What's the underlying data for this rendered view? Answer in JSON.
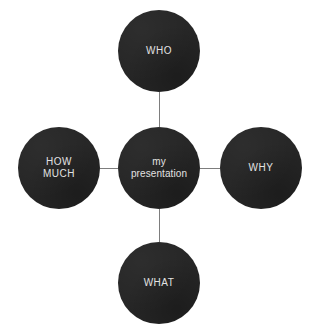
{
  "diagram": {
    "type": "mind-map",
    "shape": "cross",
    "background_color": "#ffffff",
    "node_fill_color": "#262626",
    "node_text_color": "#e2e2e2",
    "connector_color": "#7d7d7d",
    "clipped_header_text": "",
    "center": {
      "id": "center",
      "label": "my\npresentation",
      "cx": 159,
      "cy": 168,
      "diameter": 82
    },
    "satellites": [
      {
        "id": "who",
        "label": "WHO",
        "position": "top",
        "cx": 159,
        "cy": 51,
        "diameter": 82
      },
      {
        "id": "why",
        "label": "WHY",
        "position": "right",
        "cx": 261,
        "cy": 168,
        "diameter": 82
      },
      {
        "id": "what",
        "label": "WHAT",
        "position": "bottom",
        "cx": 159,
        "cy": 283,
        "diameter": 82
      },
      {
        "id": "how-much",
        "label": "HOW\nMUCH",
        "position": "left",
        "cx": 59,
        "cy": 168,
        "diameter": 82
      }
    ],
    "connectors": [
      {
        "id": "center-to-who",
        "orientation": "vertical",
        "x": 159,
        "y1": 92,
        "y2": 127
      },
      {
        "id": "center-to-what",
        "orientation": "vertical",
        "x": 159,
        "y1": 209,
        "y2": 242
      },
      {
        "id": "center-to-how-much",
        "orientation": "horizontal",
        "y": 168,
        "x1": 100,
        "x2": 118
      },
      {
        "id": "center-to-why",
        "orientation": "horizontal",
        "y": 168,
        "x1": 200,
        "x2": 220
      }
    ]
  }
}
